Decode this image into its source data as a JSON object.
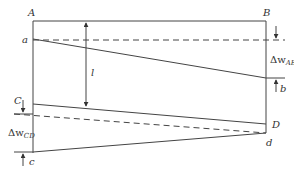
{
  "diagram": {
    "type": "deflection-geometry",
    "labels": {
      "A": "A",
      "B": "B",
      "a": "a",
      "b": "b",
      "C": "C",
      "D": "D",
      "c": "c",
      "d": "d",
      "l": "l",
      "delta_ab_main": "Δw",
      "delta_ab_sub": "AB",
      "delta_cd_main": "Δw",
      "delta_cd_sub": "CD"
    },
    "colors": {
      "line": "#444444",
      "text": "#333333",
      "background": "#ffffff"
    }
  }
}
